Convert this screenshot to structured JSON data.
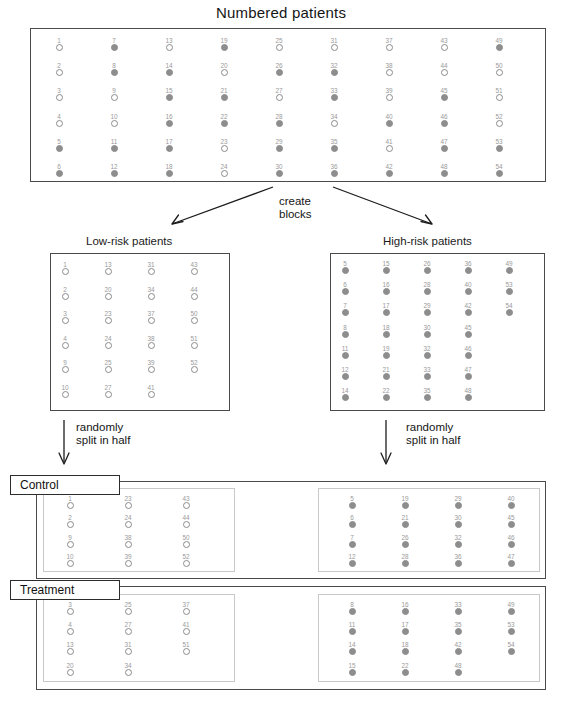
{
  "title": "Numbered patients",
  "labels": {
    "low_risk": "Low-risk patients",
    "high_risk": "High-risk patients",
    "create_blocks_line1": "create",
    "create_blocks_line2": "blocks",
    "randomly_line1": "randomly",
    "randomly_line2": "split in half",
    "control": "Control",
    "treatment": "Treatment"
  },
  "numbered_patients": {
    "columns": [
      [
        {
          "n": "1",
          "state": "open"
        },
        {
          "n": "2",
          "state": "open"
        },
        {
          "n": "3",
          "state": "open"
        },
        {
          "n": "4",
          "state": "open"
        },
        {
          "n": "5",
          "state": "filled"
        },
        {
          "n": "6",
          "state": "filled"
        }
      ],
      [
        {
          "n": "7",
          "state": "filled"
        },
        {
          "n": "8",
          "state": "filled"
        },
        {
          "n": "9",
          "state": "open"
        },
        {
          "n": "10",
          "state": "open"
        },
        {
          "n": "11",
          "state": "filled"
        },
        {
          "n": "12",
          "state": "filled"
        }
      ],
      [
        {
          "n": "13",
          "state": "open"
        },
        {
          "n": "14",
          "state": "filled"
        },
        {
          "n": "15",
          "state": "filled"
        },
        {
          "n": "16",
          "state": "filled"
        },
        {
          "n": "17",
          "state": "filled"
        },
        {
          "n": "18",
          "state": "filled"
        }
      ],
      [
        {
          "n": "19",
          "state": "filled"
        },
        {
          "n": "20",
          "state": "open"
        },
        {
          "n": "21",
          "state": "filled"
        },
        {
          "n": "22",
          "state": "filled"
        },
        {
          "n": "23",
          "state": "open"
        },
        {
          "n": "24",
          "state": "open"
        }
      ],
      [
        {
          "n": "25",
          "state": "open"
        },
        {
          "n": "26",
          "state": "filled"
        },
        {
          "n": "27",
          "state": "open"
        },
        {
          "n": "28",
          "state": "filled"
        },
        {
          "n": "29",
          "state": "filled"
        },
        {
          "n": "30",
          "state": "filled"
        }
      ],
      [
        {
          "n": "31",
          "state": "open"
        },
        {
          "n": "32",
          "state": "filled"
        },
        {
          "n": "33",
          "state": "filled"
        },
        {
          "n": "34",
          "state": "open"
        },
        {
          "n": "35",
          "state": "filled"
        },
        {
          "n": "36",
          "state": "filled"
        }
      ],
      [
        {
          "n": "37",
          "state": "open"
        },
        {
          "n": "38",
          "state": "open"
        },
        {
          "n": "39",
          "state": "open"
        },
        {
          "n": "40",
          "state": "filled"
        },
        {
          "n": "41",
          "state": "open"
        },
        {
          "n": "42",
          "state": "filled"
        }
      ],
      [
        {
          "n": "43",
          "state": "open"
        },
        {
          "n": "44",
          "state": "open"
        },
        {
          "n": "45",
          "state": "filled"
        },
        {
          "n": "46",
          "state": "filled"
        },
        {
          "n": "47",
          "state": "filled"
        },
        {
          "n": "48",
          "state": "filled"
        }
      ],
      [
        {
          "n": "49",
          "state": "filled"
        },
        {
          "n": "50",
          "state": "open"
        },
        {
          "n": "51",
          "state": "open"
        },
        {
          "n": "52",
          "state": "open"
        },
        {
          "n": "53",
          "state": "filled"
        },
        {
          "n": "54",
          "state": "filled"
        }
      ]
    ]
  },
  "low_risk_block": {
    "columns": [
      [
        {
          "n": "1",
          "state": "open"
        },
        {
          "n": "2",
          "state": "open"
        },
        {
          "n": "3",
          "state": "open"
        },
        {
          "n": "4",
          "state": "open"
        },
        {
          "n": "9",
          "state": "open"
        },
        {
          "n": "10",
          "state": "open"
        }
      ],
      [
        {
          "n": "13",
          "state": "open"
        },
        {
          "n": "20",
          "state": "open"
        },
        {
          "n": "23",
          "state": "open"
        },
        {
          "n": "24",
          "state": "open"
        },
        {
          "n": "25",
          "state": "open"
        },
        {
          "n": "27",
          "state": "open"
        }
      ],
      [
        {
          "n": "31",
          "state": "open"
        },
        {
          "n": "34",
          "state": "open"
        },
        {
          "n": "37",
          "state": "open"
        },
        {
          "n": "38",
          "state": "open"
        },
        {
          "n": "39",
          "state": "open"
        },
        {
          "n": "41",
          "state": "open"
        }
      ],
      [
        {
          "n": "43",
          "state": "open"
        },
        {
          "n": "44",
          "state": "open"
        },
        {
          "n": "50",
          "state": "open"
        },
        {
          "n": "51",
          "state": "open"
        },
        {
          "n": "52",
          "state": "open"
        }
      ]
    ]
  },
  "high_risk_block": {
    "columns": [
      [
        {
          "n": "5",
          "state": "filled"
        },
        {
          "n": "6",
          "state": "filled"
        },
        {
          "n": "7",
          "state": "filled"
        },
        {
          "n": "8",
          "state": "filled"
        },
        {
          "n": "11",
          "state": "filled"
        },
        {
          "n": "12",
          "state": "filled"
        },
        {
          "n": "14",
          "state": "filled"
        }
      ],
      [
        {
          "n": "15",
          "state": "filled"
        },
        {
          "n": "16",
          "state": "filled"
        },
        {
          "n": "17",
          "state": "filled"
        },
        {
          "n": "18",
          "state": "filled"
        },
        {
          "n": "19",
          "state": "filled"
        },
        {
          "n": "21",
          "state": "filled"
        },
        {
          "n": "22",
          "state": "filled"
        }
      ],
      [
        {
          "n": "26",
          "state": "filled"
        },
        {
          "n": "28",
          "state": "filled"
        },
        {
          "n": "29",
          "state": "filled"
        },
        {
          "n": "30",
          "state": "filled"
        },
        {
          "n": "32",
          "state": "filled"
        },
        {
          "n": "33",
          "state": "filled"
        },
        {
          "n": "35",
          "state": "filled"
        }
      ],
      [
        {
          "n": "36",
          "state": "filled"
        },
        {
          "n": "40",
          "state": "filled"
        },
        {
          "n": "42",
          "state": "filled"
        },
        {
          "n": "45",
          "state": "filled"
        },
        {
          "n": "46",
          "state": "filled"
        },
        {
          "n": "47",
          "state": "filled"
        },
        {
          "n": "48",
          "state": "filled"
        }
      ],
      [
        {
          "n": "49",
          "state": "filled"
        },
        {
          "n": "53",
          "state": "filled"
        },
        {
          "n": "54",
          "state": "filled"
        }
      ]
    ]
  },
  "control_low": {
    "columns": [
      [
        {
          "n": "1",
          "state": "open"
        },
        {
          "n": "2",
          "state": "open"
        },
        {
          "n": "9",
          "state": "open"
        },
        {
          "n": "10",
          "state": "open"
        }
      ],
      [
        {
          "n": "23",
          "state": "open"
        },
        {
          "n": "24",
          "state": "open"
        },
        {
          "n": "38",
          "state": "open"
        },
        {
          "n": "39",
          "state": "open"
        }
      ],
      [
        {
          "n": "43",
          "state": "open"
        },
        {
          "n": "44",
          "state": "open"
        },
        {
          "n": "50",
          "state": "open"
        },
        {
          "n": "52",
          "state": "open"
        }
      ]
    ]
  },
  "control_high": {
    "columns": [
      [
        {
          "n": "5",
          "state": "filled"
        },
        {
          "n": "6",
          "state": "filled"
        },
        {
          "n": "7",
          "state": "filled"
        },
        {
          "n": "12",
          "state": "filled"
        }
      ],
      [
        {
          "n": "19",
          "state": "filled"
        },
        {
          "n": "21",
          "state": "filled"
        },
        {
          "n": "26",
          "state": "filled"
        },
        {
          "n": "28",
          "state": "filled"
        }
      ],
      [
        {
          "n": "29",
          "state": "filled"
        },
        {
          "n": "30",
          "state": "filled"
        },
        {
          "n": "32",
          "state": "filled"
        },
        {
          "n": "36",
          "state": "filled"
        }
      ],
      [
        {
          "n": "40",
          "state": "filled"
        },
        {
          "n": "45",
          "state": "filled"
        },
        {
          "n": "46",
          "state": "filled"
        },
        {
          "n": "47",
          "state": "filled"
        }
      ]
    ]
  },
  "treatment_low": {
    "columns": [
      [
        {
          "n": "3",
          "state": "open"
        },
        {
          "n": "4",
          "state": "open"
        },
        {
          "n": "13",
          "state": "open"
        },
        {
          "n": "20",
          "state": "open"
        }
      ],
      [
        {
          "n": "25",
          "state": "open"
        },
        {
          "n": "27",
          "state": "open"
        },
        {
          "n": "31",
          "state": "open"
        },
        {
          "n": "34",
          "state": "open"
        }
      ],
      [
        {
          "n": "37",
          "state": "open"
        },
        {
          "n": "41",
          "state": "open"
        },
        {
          "n": "51",
          "state": "open"
        }
      ]
    ]
  },
  "treatment_high": {
    "columns": [
      [
        {
          "n": "8",
          "state": "filled"
        },
        {
          "n": "11",
          "state": "filled"
        },
        {
          "n": "14",
          "state": "filled"
        },
        {
          "n": "15",
          "state": "filled"
        }
      ],
      [
        {
          "n": "16",
          "state": "filled"
        },
        {
          "n": "17",
          "state": "filled"
        },
        {
          "n": "18",
          "state": "filled"
        },
        {
          "n": "22",
          "state": "filled"
        }
      ],
      [
        {
          "n": "33",
          "state": "filled"
        },
        {
          "n": "35",
          "state": "filled"
        },
        {
          "n": "42",
          "state": "filled"
        },
        {
          "n": "48",
          "state": "filled"
        }
      ],
      [
        {
          "n": "49",
          "state": "filled"
        },
        {
          "n": "53",
          "state": "filled"
        },
        {
          "n": "54",
          "state": "filled"
        }
      ]
    ]
  },
  "colors": {
    "open_dot_stroke": "#8b8b8b",
    "filled_dot": "#8d8d8d",
    "number_text": "#9a9a9a",
    "box_border": "#4a4a4a",
    "inner_border": "#c9c9c9",
    "arrow": "#1c1c1c"
  }
}
